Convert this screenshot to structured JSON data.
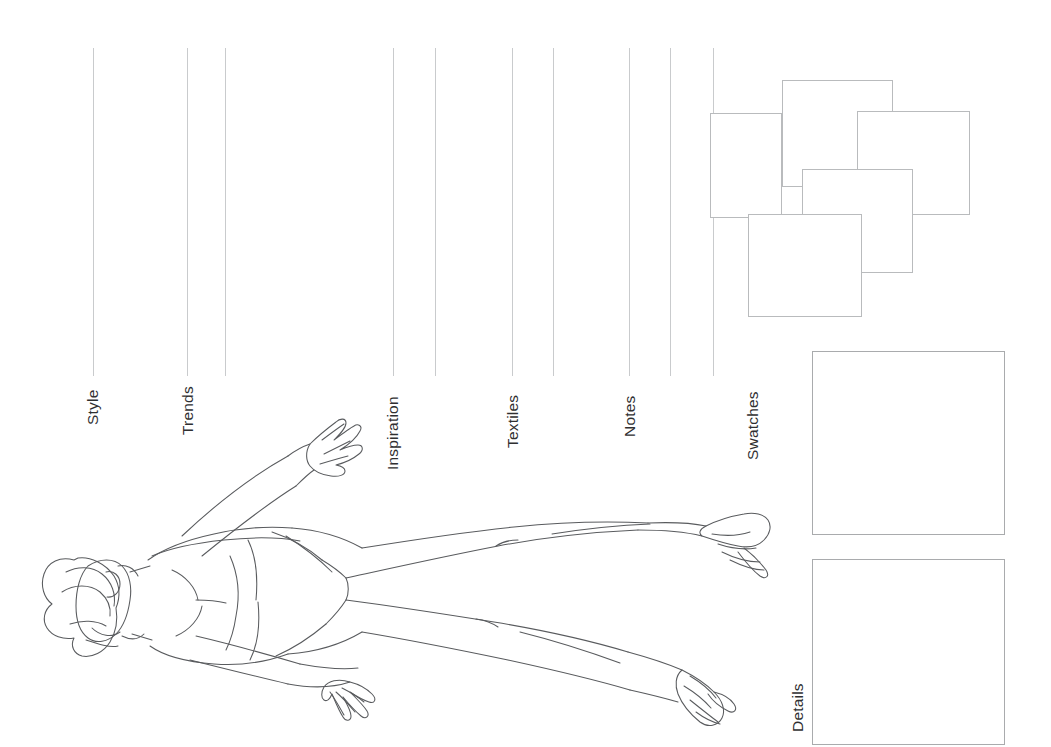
{
  "page": {
    "background_color": "#ffffff",
    "width": 1051,
    "height": 747,
    "orientation": "landscape-rotated-content",
    "line_color": "#c9cbcd",
    "box_border_color": "#a9abad",
    "text_color": "#2f2f31",
    "figure_stroke_color": "#595b5e"
  },
  "sections": [
    {
      "label": "Style",
      "x": 85,
      "baseline_y": 425,
      "rule_x": 93,
      "rule_top": 48,
      "rule_bottom": 376
    },
    {
      "label": "Trends",
      "x": 180,
      "baseline_y": 435,
      "rule_x": 187,
      "rule_top": 48,
      "rule_bottom": 376
    },
    {
      "label": "Inspiration",
      "x": 385,
      "baseline_y": 470,
      "rule_x": 393,
      "rule_top": 48,
      "rule_bottom": 376
    },
    {
      "label": "Textiles",
      "x": 505,
      "baseline_y": 448,
      "rule_x": 512,
      "rule_top": 48,
      "rule_bottom": 376
    },
    {
      "label": "Notes",
      "x": 622,
      "baseline_y": 437,
      "rule_x": 629,
      "rule_top": 48,
      "rule_bottom": 376
    },
    {
      "label": "Swatches",
      "x": 745,
      "baseline_y": 460,
      "rule_x": 713,
      "rule_top": 48,
      "rule_bottom": 376
    },
    {
      "label": "Details",
      "x": 790,
      "baseline_y": 732,
      "rule_x": null,
      "rule_top": null,
      "rule_bottom": null
    }
  ],
  "extra_rules": [
    {
      "x": 225,
      "top": 48,
      "bottom": 376
    },
    {
      "x": 435,
      "top": 48,
      "bottom": 376
    },
    {
      "x": 553,
      "top": 48,
      "bottom": 376
    },
    {
      "x": 670,
      "top": 48,
      "bottom": 376
    }
  ],
  "swatch_collage": {
    "name": "overlapping-swatch-squares",
    "count": 5,
    "squares": [
      {
        "id": "swatch-square-left",
        "x": 710,
        "y": 113,
        "w": 72,
        "h": 105
      },
      {
        "id": "swatch-square-top",
        "x": 782,
        "y": 80,
        "w": 111,
        "h": 107
      },
      {
        "id": "swatch-square-right",
        "x": 857,
        "y": 111,
        "w": 113,
        "h": 104
      },
      {
        "id": "swatch-square-center",
        "x": 802,
        "y": 169,
        "w": 111,
        "h": 104
      },
      {
        "id": "swatch-square-bottom",
        "x": 748,
        "y": 214,
        "w": 114,
        "h": 103
      }
    ]
  },
  "panels": [
    {
      "id": "swatches-panel",
      "label_ref": "Swatches",
      "x": 812,
      "y": 351,
      "w": 193,
      "h": 184
    },
    {
      "id": "details-panel",
      "label_ref": "Details",
      "x": 812,
      "y": 559,
      "w": 193,
      "h": 186
    }
  ],
  "figure": {
    "name": "fashion-croquis-figure",
    "parts": [
      "hair",
      "head",
      "torso",
      "left-arm",
      "right-arm",
      "hands",
      "briefs",
      "left-leg",
      "right-leg",
      "heeled-shoes"
    ]
  }
}
